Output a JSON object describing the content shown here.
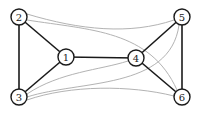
{
  "diagram": {
    "type": "graph",
    "nodes": [
      {
        "id": "1",
        "label": "1",
        "x": 66,
        "y": 57
      },
      {
        "id": "2",
        "label": "2",
        "x": 19,
        "y": 17
      },
      {
        "id": "3",
        "label": "3",
        "x": 19,
        "y": 97
      },
      {
        "id": "4",
        "label": "4",
        "x": 136,
        "y": 58
      },
      {
        "id": "5",
        "label": "5",
        "x": 182,
        "y": 17
      },
      {
        "id": "6",
        "label": "6",
        "x": 182,
        "y": 97
      }
    ],
    "edges_solid": [
      [
        "2",
        "3"
      ],
      [
        "2",
        "1"
      ],
      [
        "3",
        "1"
      ],
      [
        "1",
        "4"
      ],
      [
        "4",
        "5"
      ],
      [
        "4",
        "6"
      ],
      [
        "5",
        "6"
      ]
    ],
    "edges_curved_gray": [
      [
        "2",
        "5"
      ],
      [
        "2",
        "6"
      ],
      [
        "3",
        "4"
      ],
      [
        "3",
        "5"
      ],
      [
        "3",
        "6"
      ]
    ],
    "colors": {
      "solid_edge": "#1a1a1a",
      "curved_edge": "#b0b0b0",
      "node_fill": "#ffffff",
      "node_stroke": "#1a1a1a"
    }
  }
}
